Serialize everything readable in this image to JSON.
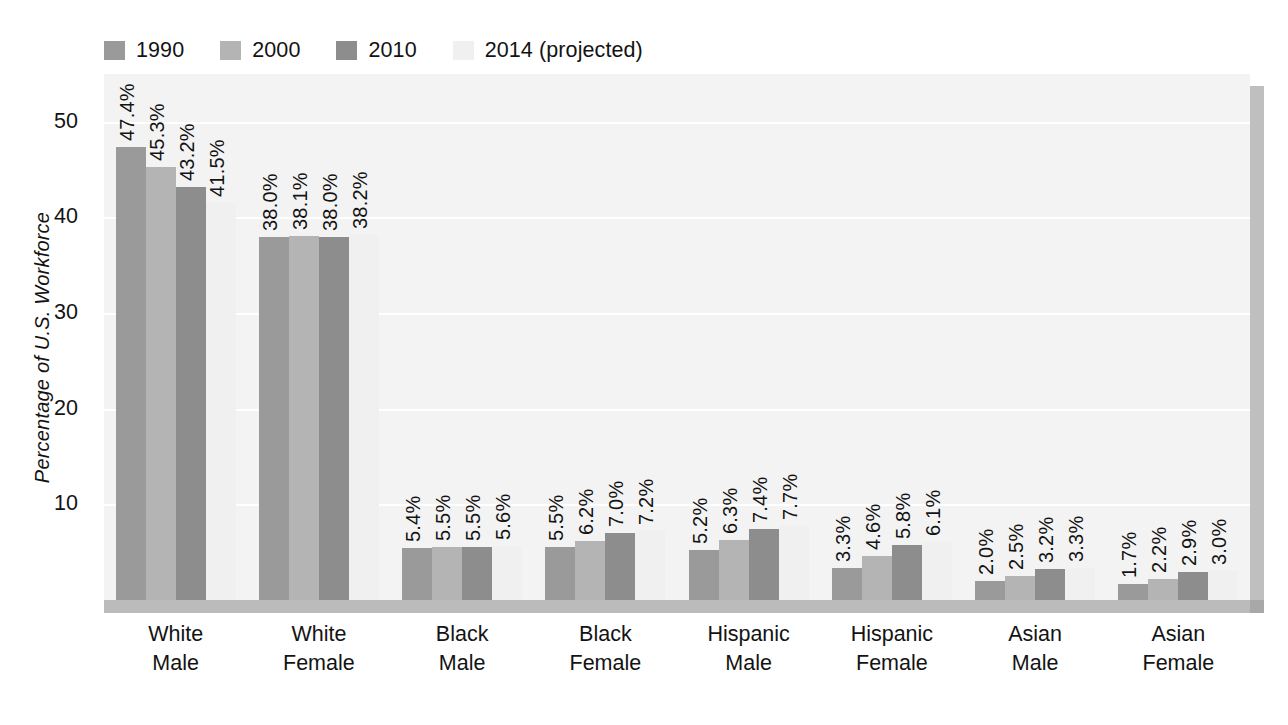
{
  "chart_data": {
    "type": "bar",
    "title": "",
    "subtitle": "",
    "xlabel": "",
    "ylabel": "Percentage of U.S. Workforce",
    "ylim": [
      0,
      55
    ],
    "yticks": [
      10,
      20,
      30,
      40,
      50
    ],
    "ytick_labels": [
      "10",
      "20",
      "30",
      "40",
      "50"
    ],
    "grid": true,
    "legend_position": "top-left",
    "value_label_suffix": "%",
    "value_labels_rotated": true,
    "categories": [
      "White Male",
      "White Female",
      "Black Male",
      "Black Female",
      "Hispanic Male",
      "Hispanic Female",
      "Asian Male",
      "Asian Female"
    ],
    "category_lines": [
      [
        "White",
        "Male"
      ],
      [
        "White",
        "Female"
      ],
      [
        "Black",
        "Male"
      ],
      [
        "Black",
        "Female"
      ],
      [
        "Hispanic",
        "Male"
      ],
      [
        "Hispanic",
        "Female"
      ],
      [
        "Asian",
        "Male"
      ],
      [
        "Asian",
        "Female"
      ]
    ],
    "series": [
      {
        "name": "1990",
        "color": "#9a9a9a",
        "values": [
          47.4,
          38.0,
          5.4,
          5.5,
          5.2,
          3.3,
          2.0,
          1.7
        ],
        "labels": [
          "47.4%",
          "38.0%",
          "5.4%",
          "5.5%",
          "5.2%",
          "3.3%",
          "2.0%",
          "1.7%"
        ]
      },
      {
        "name": "2000",
        "color": "#b4b4b4",
        "values": [
          45.3,
          38.1,
          5.5,
          6.2,
          6.3,
          4.6,
          2.5,
          2.2
        ],
        "labels": [
          "45.3%",
          "38.1%",
          "5.5%",
          "6.2%",
          "6.3%",
          "4.6%",
          "2.5%",
          "2.2%"
        ]
      },
      {
        "name": "2010",
        "color": "#8d8d8d",
        "values": [
          43.2,
          38.0,
          5.5,
          7.0,
          7.4,
          5.8,
          3.2,
          2.9
        ],
        "labels": [
          "43.2%",
          "38.0%",
          "5.5%",
          "7.0%",
          "7.4%",
          "5.8%",
          "3.2%",
          "2.9%"
        ]
      },
      {
        "name": "2014 (projected)",
        "color": "#f0f0f0",
        "values": [
          41.5,
          38.2,
          5.6,
          7.2,
          7.7,
          6.1,
          3.3,
          3.0
        ],
        "labels": [
          "41.5%",
          "38.2%",
          "5.6%",
          "7.2%",
          "7.7%",
          "6.1%",
          "3.3%",
          "3.0%"
        ]
      }
    ]
  },
  "legend": {
    "items": [
      {
        "label": "1990",
        "color": "#9a9a9a"
      },
      {
        "label": "2000",
        "color": "#b4b4b4"
      },
      {
        "label": "2010",
        "color": "#8d8d8d"
      },
      {
        "label": "2014 (projected)",
        "color": "#f0f0f0"
      }
    ]
  },
  "style": {
    "plot_background": "#f3f3f3",
    "gridline_color": "#ffffff",
    "floor_color": "#bbbbbb",
    "wall_color": "#bfbfbf",
    "page_background": "#ffffff",
    "text_color": "#131313"
  }
}
